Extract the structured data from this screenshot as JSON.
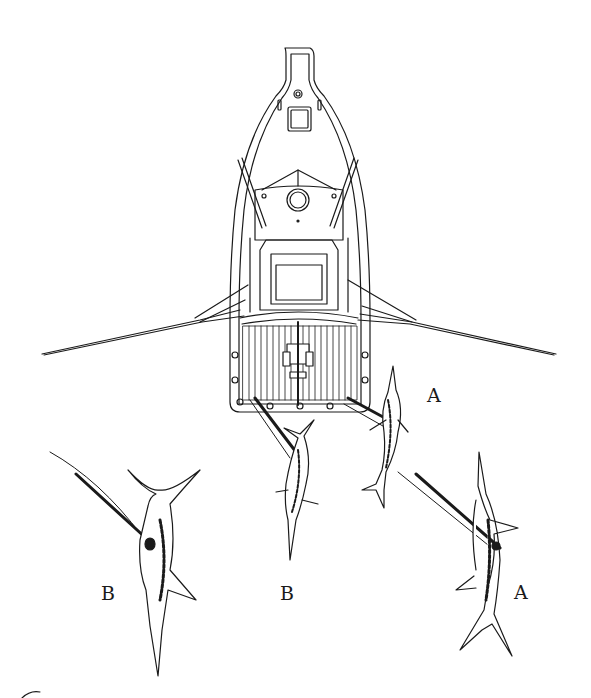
{
  "figure": {
    "colors": {
      "ink": "#1a1a1a",
      "background": "#ffffff"
    }
  },
  "labels": {
    "a_upper": "A",
    "a_lower": "A",
    "b_left": "B",
    "b_center": "B"
  },
  "elements": {
    "boat": "boat-top-view",
    "outriggers": [
      "port-outrigger",
      "starboard-outrigger"
    ],
    "fish": [
      {
        "id": "marlin-a-near-stern",
        "label": "A"
      },
      {
        "id": "marlin-b-near-stern",
        "label": "B"
      },
      {
        "id": "marlin-b-left",
        "label": "B"
      },
      {
        "id": "marlin-a-right",
        "label": "A"
      }
    ]
  }
}
